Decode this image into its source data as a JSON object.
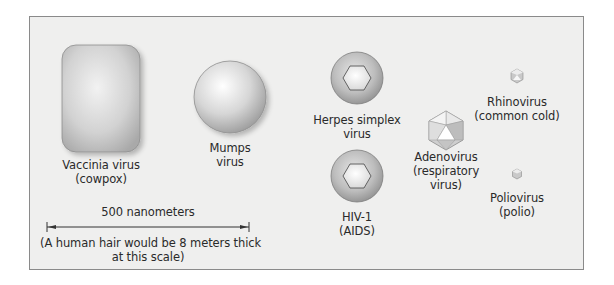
{
  "figure": {
    "viruses": [
      {
        "id": "vaccinia",
        "line1": "Vaccinia virus",
        "line2": "(cowpox)",
        "shape": "brick"
      },
      {
        "id": "mumps",
        "line1": "Mumps",
        "line2": "virus",
        "shape": "sphere"
      },
      {
        "id": "herpes",
        "line1": "Herpes simplex",
        "line2": "virus",
        "shape": "enveloped-hexagon"
      },
      {
        "id": "hiv",
        "line1": "HIV-1",
        "line2": "(AIDS)",
        "shape": "enveloped-hexagon"
      },
      {
        "id": "adenovirus",
        "line1": "Adenovirus",
        "line2": "(respiratory",
        "line3": "virus)",
        "shape": "icosahedron"
      },
      {
        "id": "rhinovirus",
        "line1": "Rhinovirus",
        "line2": "(common cold)",
        "shape": "icosahedron"
      },
      {
        "id": "poliovirus",
        "line1": "Poliovirus",
        "line2": "(polio)",
        "shape": "icosahedron"
      }
    ],
    "scale_bar": {
      "label": "500 nanometers",
      "note_line1": "(A human hair would be 8 meters thick",
      "note_line2": "at this scale)"
    },
    "colors": {
      "background": "#efefee",
      "border": "#8a8a8a",
      "virus_gray": "#b5b5b5",
      "text": "#2a2a2a"
    }
  }
}
